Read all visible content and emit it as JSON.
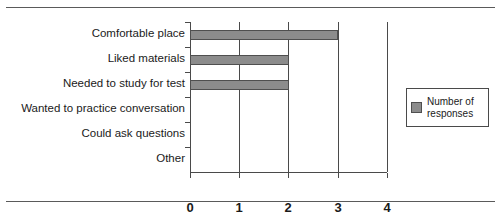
{
  "chart_data": {
    "type": "bar",
    "orientation": "horizontal",
    "title": "",
    "xlabel": "",
    "ylabel": "",
    "categories": [
      "Comfortable place",
      "Liked materials",
      "Needed to study for test",
      "Wanted to practice conversation",
      "Could ask questions",
      "Other"
    ],
    "values": [
      3,
      2,
      2,
      0,
      0,
      0
    ],
    "series": [
      {
        "name": "Number of responses",
        "values": [
          3,
          2,
          2,
          0,
          0,
          0
        ]
      }
    ],
    "xlim": [
      0,
      4
    ],
    "xticks": [
      "0",
      "1",
      "2",
      "3",
      "4"
    ],
    "xtick_values": [
      0,
      1,
      2,
      3,
      4
    ],
    "grid": true,
    "grid_axis": "x",
    "legend_position": "right",
    "bar_color": "#8c8c8c",
    "bar_edge_color": "#4f4f4f",
    "axis_color": "#4a4a4a"
  },
  "legend": {
    "entries": [
      {
        "label_line1": "Number of",
        "label_line2": "responses",
        "color": "#8c8c8c"
      }
    ]
  },
  "rules": {
    "top_visible": true,
    "bottom_visible": true,
    "color": "#5a5a5a"
  }
}
